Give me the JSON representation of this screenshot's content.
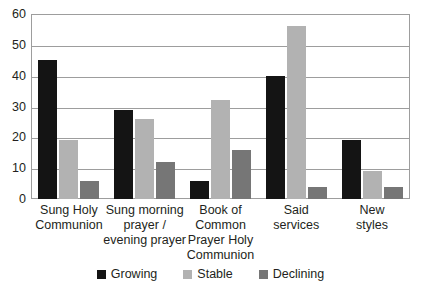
{
  "chart_data": {
    "type": "bar",
    "title": "",
    "subtitle": "",
    "xlabel": "",
    "ylabel": "",
    "ylim": [
      0,
      60
    ],
    "yticks": [
      0,
      10,
      20,
      30,
      40,
      50,
      60
    ],
    "grid": true,
    "legend_position": "bottom-center",
    "categories": [
      "Sung Holy\nCommunion",
      "Sung morning\nprayer /\nevening prayer",
      "Book of\nCommon\nPrayer Holy\nCommunion",
      "Said\nservices",
      "New\nstyles"
    ],
    "category_lines": [
      [
        "Sung Holy",
        "Communion"
      ],
      [
        "Sung morning",
        "prayer /",
        "evening prayer"
      ],
      [
        "Book of",
        "Common",
        "Prayer Holy",
        "Communion"
      ],
      [
        "Said",
        "services"
      ],
      [
        "New",
        "styles"
      ]
    ],
    "series": [
      {
        "name": "Growing",
        "color": "#141414",
        "values": [
          45,
          29,
          6,
          40,
          19
        ]
      },
      {
        "name": "Stable",
        "color": "#b2b2b2",
        "values": [
          19,
          26,
          32,
          56,
          9
        ]
      },
      {
        "name": "Declining",
        "color": "#767676",
        "values": [
          6,
          12,
          16,
          4,
          4
        ]
      }
    ]
  },
  "legend": {
    "items": [
      {
        "label": "Growing",
        "key": "growing"
      },
      {
        "label": "Stable",
        "key": "stable"
      },
      {
        "label": "Declining",
        "key": "declining"
      }
    ]
  },
  "axis": {
    "y_tick_labels": [
      "0",
      "10",
      "20",
      "30",
      "40",
      "50",
      "60"
    ]
  },
  "colors": {
    "growing": "#141414",
    "stable": "#b2b2b2",
    "declining": "#767676",
    "gridline": "#9d9d9d",
    "text": "#231f20",
    "background": "#ffffff"
  }
}
